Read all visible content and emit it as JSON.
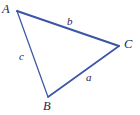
{
  "figure": {
    "type": "geometry-diagram",
    "shape": "triangle",
    "background_color": "#ffffff",
    "stroke_color": "#3c56a6",
    "label_color": "#23234f",
    "vertices": [
      {
        "name": "A",
        "label": "A",
        "x": 17,
        "y": 11
      },
      {
        "name": "B",
        "label": "B",
        "x": 48,
        "y": 97
      },
      {
        "name": "C",
        "label": "C",
        "x": 119,
        "y": 46
      }
    ],
    "sides": [
      {
        "name": "a",
        "label": "a",
        "between": "B-C",
        "label_x": 89,
        "label_y": 78
      },
      {
        "name": "b",
        "label": "b",
        "between": "A-C",
        "label_x": 71,
        "label_y": 22
      },
      {
        "name": "c",
        "label": "c",
        "between": "A-B",
        "label_x": 22,
        "label_y": 57
      }
    ]
  }
}
